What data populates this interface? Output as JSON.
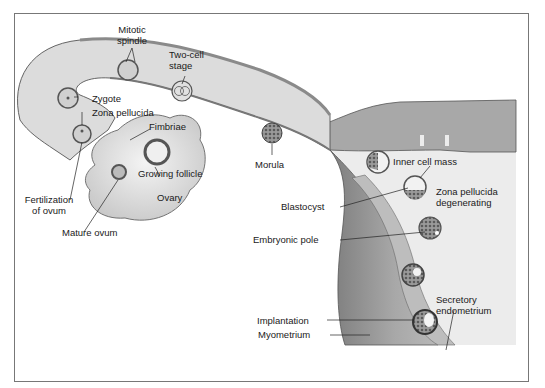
{
  "diagram": {
    "labels": {
      "mitotic_spindle": "Mitotic spindle",
      "mitotic_spindle_1": "Mitotic",
      "mitotic_spindle_2": "spindle",
      "two_cell_1": "Two-cell",
      "two_cell_2": "stage",
      "zygote": "Zygote",
      "zona_pellucida": "Zona pellucida",
      "fimbriae": "Fimbriae",
      "growing_follicle": "Growing follicle",
      "ovary": "Ovary",
      "fertilization_1": "Fertilization",
      "fertilization_2": "of ovum",
      "mature_ovum": "Mature ovum",
      "morula": "Morula",
      "inner_cell_mass": "Inner cell mass",
      "blastocyst": "Blastocyst",
      "zona_degenerating_1": "Zona pellucida",
      "zona_degenerating_2": "degenerating",
      "embryonic_pole": "Embryonic pole",
      "secretory_1": "Secretory",
      "secretory_2": "endometrium",
      "implantation": "Implantation",
      "myometrium": "Myometrium"
    },
    "colors": {
      "tube_fill": "#d9d9d9",
      "tube_dark": "#8a8a8a",
      "wall": "#9e9e9e",
      "endometrium": "#bdbdbd",
      "cavity": "#ececec",
      "ovary": "#e4e4e4",
      "frame": "#777777"
    }
  }
}
